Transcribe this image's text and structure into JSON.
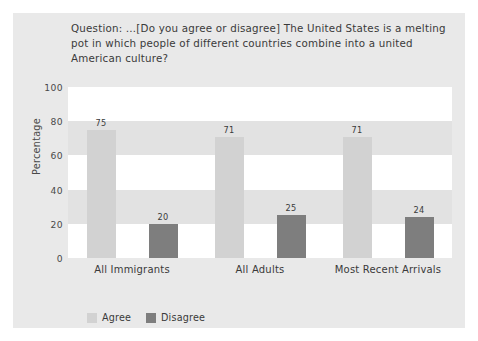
{
  "figure": {
    "panel_bg": "#e9e9e9",
    "plot_bg": "#ffffff",
    "band_color": "#e2e2e2"
  },
  "title": {
    "text": "Question: …[Do you agree or disagree] The United States is a melting pot in which people of different countries combine into a united American culture?"
  },
  "chart_data": {
    "type": "bar",
    "title": "Question: …[Do you agree or disagree] The United States is a melting pot in which people of different countries combine into a united American culture?",
    "xlabel": "",
    "ylabel": "Percentage",
    "ylim": [
      0,
      100
    ],
    "yticks": [
      0,
      20,
      40,
      60,
      80,
      100
    ],
    "ytick_labels": [
      "0",
      "20",
      "40",
      "60",
      "80",
      "100"
    ],
    "grid": false,
    "banded_background": true,
    "legend_position": "bottom-left",
    "categories": [
      "All Immigrants",
      "All Adults",
      "Most Recent Arrivals"
    ],
    "series": [
      {
        "name": "Agree",
        "color": "#d2d2d2",
        "values": [
          75,
          71,
          71
        ],
        "value_labels": [
          "75",
          "71",
          "71"
        ]
      },
      {
        "name": "Disagree",
        "color": "#7e7e7e",
        "values": [
          20,
          25,
          24
        ],
        "value_labels": [
          "20",
          "25",
          "24"
        ]
      }
    ]
  },
  "legend": {
    "items": [
      {
        "label": "Agree",
        "color": "#d2d2d2"
      },
      {
        "label": "Disagree",
        "color": "#7e7e7e"
      }
    ]
  }
}
